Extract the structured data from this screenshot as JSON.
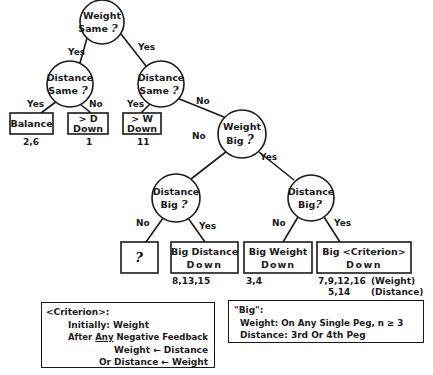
{
  "diagram": {
    "type": "decision-tree",
    "nodes": {
      "root": {
        "line1": "Weight",
        "line2": "Same",
        "q": "?"
      },
      "dist_same_left": {
        "line1": "Distance",
        "line2": "Same",
        "q": "?"
      },
      "dist_same_right": {
        "line1": "Distance",
        "line2": "Same",
        "q": "?"
      },
      "weight_big": {
        "line1": "Weight",
        "line2": "Big",
        "q": "?"
      },
      "dist_big_left": {
        "line1": "Distance",
        "line2": "Big",
        "q": "?"
      },
      "dist_big_right": {
        "line1": "Distance",
        "line2": "Big",
        "q": "?"
      }
    },
    "edges": {
      "root_left": "Yes",
      "root_right": "Yes",
      "dsl_left": "Yes",
      "dsl_right": "No",
      "dsr_left": "Yes",
      "dsr_right": "No",
      "wb_left": "No",
      "wb_right": "Yes",
      "dbl_left": "No",
      "dbl_right": "Yes",
      "dbr_left": "No",
      "dbr_right": "Yes"
    },
    "leaves": {
      "balance": {
        "line1": "Balance",
        "cases": "2,6"
      },
      "greater_d": {
        "line1": "> D",
        "line2": "Down",
        "cases": "1"
      },
      "greater_w": {
        "line1": "> W",
        "line2": "Down",
        "cases": "11"
      },
      "unknown": {
        "line1": "?",
        "cases": ""
      },
      "big_distance": {
        "line1": "Big Distance",
        "line2": "Down",
        "cases": "8,13,15"
      },
      "big_weight": {
        "line1": "Big Weight",
        "line2": "Down",
        "cases": "3,4"
      },
      "big_criterion": {
        "line1": "Big <Criterion>",
        "line2": "Down",
        "cases_weight": "7,9,12,16",
        "label_weight": "(Weight)",
        "cases_distance": "5,14",
        "label_distance": "(Distance)"
      }
    }
  },
  "legend_criterion": {
    "title": "<Criterion>:",
    "initially_label": "Initially:",
    "initially_value": "Weight",
    "after_prefix": "After",
    "after_any": "Any",
    "after_suffix": "Negative Feedback",
    "rule1": "Weight ← Distance",
    "rule2": "Or Distance ← Weight"
  },
  "legend_big": {
    "title": "\"Big\":",
    "weight_label": "Weight:",
    "weight_value": "On Any Single Peg, n ≥ 3",
    "distance_label": "Distance:",
    "distance_value": "3rd Or 4th Peg"
  }
}
